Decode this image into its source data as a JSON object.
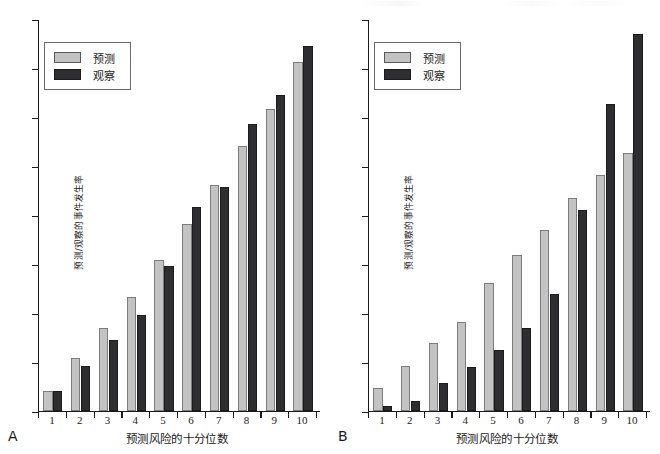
{
  "figure": {
    "background": "#ffffff",
    "colors": {
      "predicted": "#c3c3c3",
      "observed": "#2e2e30",
      "axis": "#1a1a1a"
    }
  },
  "panels": [
    {
      "letter": "A",
      "xlabel": "预测风险的十分位数",
      "ylabel": "预测/观察的事件发生率",
      "legend": {
        "predicted_label": "预测",
        "observed_label": "观察"
      }
    },
    {
      "letter": "B",
      "xlabel": "预测风险的十分位数",
      "ylabel": "预测/观察的事件发生率",
      "legend": {
        "predicted_label": "预测",
        "observed_label": "观察"
      }
    }
  ],
  "chart_data": [
    {
      "type": "bar",
      "panel": "A",
      "title": "",
      "xlabel": "预测风险的十分位数",
      "ylabel": "预测/观察的事件发生率",
      "categories": [
        "1",
        "2",
        "3",
        "4",
        "5",
        "6",
        "7",
        "8",
        "9",
        "10"
      ],
      "series": [
        {
          "name": "预测",
          "values": [
            5.0,
            13.5,
            21.0,
            29.0,
            38.5,
            47.5,
            57.5,
            67.5,
            77.0,
            89.0
          ]
        },
        {
          "name": "观察",
          "values": [
            5.0,
            11.5,
            18.0,
            24.5,
            37.0,
            52.0,
            57.0,
            73.0,
            80.5,
            93.0
          ]
        }
      ],
      "ylim": [
        0,
        100
      ],
      "grid": false,
      "legend_position": "top-left",
      "y_ticks_labeled": false,
      "n_y_ticks": 8
    },
    {
      "type": "bar",
      "panel": "B",
      "title": "",
      "xlabel": "预测风险的十分位数",
      "ylabel": "预测/观察的事件发生率",
      "categories": [
        "1",
        "2",
        "3",
        "4",
        "5",
        "6",
        "7",
        "8",
        "9",
        "10"
      ],
      "series": [
        {
          "name": "预测",
          "values": [
            8.0,
            16.0,
            24.0,
            31.5,
            45.5,
            55.5,
            64.5,
            76.0,
            84.0,
            92.0
          ]
        },
        {
          "name": "观察",
          "values": [
            1.5,
            3.5,
            10.0,
            15.5,
            21.5,
            29.5,
            41.5,
            71.5,
            109.5,
            134.5
          ]
        }
      ],
      "ylim": [
        0,
        140
      ],
      "grid": false,
      "legend_position": "top-left",
      "y_ticks_labeled": false,
      "n_y_ticks": 8
    }
  ]
}
